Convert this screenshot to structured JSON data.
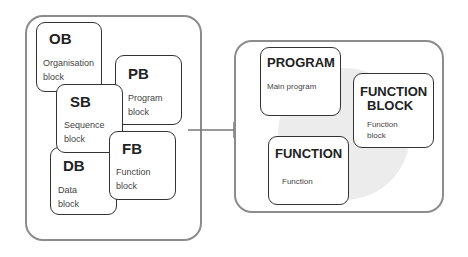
{
  "left_group": {
    "blocks": [
      {
        "code": "OB",
        "desc": "Organisation\nblock",
        "desc1": "Organisation",
        "desc2": "block"
      },
      {
        "code": "PB",
        "desc1": "Program",
        "desc2": "block"
      },
      {
        "code": "SB",
        "desc1": "Sequence",
        "desc2": "block"
      },
      {
        "code": "DB",
        "desc1": "Data",
        "desc2": "block"
      },
      {
        "code": "FB",
        "desc1": "Function",
        "desc2": "block"
      }
    ]
  },
  "right_group": {
    "blocks": [
      {
        "title": "PROGRAM",
        "desc1": "Main program"
      },
      {
        "title1": "FUNCTION",
        "title2": "BLOCK",
        "desc1": "Function",
        "desc2": "block"
      },
      {
        "title": "FUNCTION",
        "desc1": "Function"
      }
    ]
  },
  "colors": {
    "frame": "#8c8c8c",
    "block_border": "#333333",
    "circle": "#ececec"
  }
}
